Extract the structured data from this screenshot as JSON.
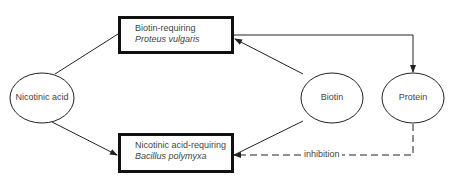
{
  "diagram": {
    "boxes": {
      "top": {
        "line1": "Biotin-requiring",
        "line2": "Proteus vulgaris"
      },
      "bottom": {
        "line1": "Nicotinic acid-requiring",
        "line2": "Bacillus polymyxa"
      }
    },
    "nodes": {
      "nicotinic_acid": "Nicotinic acid",
      "biotin": "Biotin",
      "protein": "Protein"
    },
    "edges": [
      {
        "from": "Nicotinic acid",
        "to": "Biotin-requiring Proteus vulgaris",
        "style": "solid",
        "arrow": false
      },
      {
        "from": "Nicotinic acid",
        "to": "Nicotinic acid-requiring Bacillus polymyxa",
        "style": "solid",
        "arrow": true
      },
      {
        "from": "Biotin",
        "to": "Biotin-requiring Proteus vulgaris",
        "style": "solid",
        "arrow": true
      },
      {
        "from": "Biotin",
        "to": "Nicotinic acid-requiring Bacillus polymyxa",
        "style": "solid",
        "arrow": false
      },
      {
        "from": "Biotin-requiring Proteus vulgaris",
        "to": "Protein",
        "style": "solid",
        "arrow": true
      },
      {
        "from": "Protein",
        "to": "Nicotinic acid-requiring Bacillus polymyxa",
        "style": "dashed",
        "arrow": true,
        "label": "inhibition"
      }
    ],
    "inhibition_label": "inhibition"
  }
}
